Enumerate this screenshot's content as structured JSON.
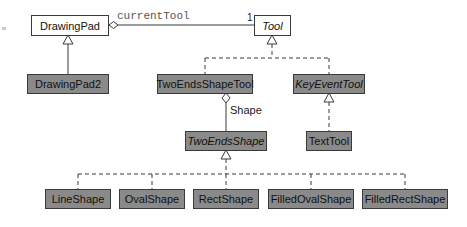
{
  "diagram": {
    "type": "uml-class-diagram",
    "classes": {
      "drawing_pad": "DrawingPad",
      "tool": "Tool",
      "drawing_pad2": "DrawingPad2",
      "two_ends_shape_tool": "TwoEndsShapeTool",
      "key_event_tool": "KeyEventTool",
      "two_ends_shape": "TwoEndsShape",
      "text_tool": "TextTool",
      "line_shape": "LineShape",
      "oval_shape": "OvalShape",
      "rect_shape": "RectShape",
      "filled_oval_shape": "FilledOvalShape",
      "filled_rect_shape": "FilledRectShape"
    },
    "labels": {
      "current_tool": "currentTool",
      "multiplicity": "1",
      "shape": "Shape"
    },
    "relations": [
      {
        "from": "DrawingPad",
        "to": "Tool",
        "type": "aggregation",
        "role": "currentTool",
        "multiplicity": "1"
      },
      {
        "from": "DrawingPad2",
        "to": "DrawingPad",
        "type": "generalization"
      },
      {
        "from": "TwoEndsShapeTool",
        "to": "Tool",
        "type": "realization"
      },
      {
        "from": "KeyEventTool",
        "to": "Tool",
        "type": "realization"
      },
      {
        "from": "TextTool",
        "to": "KeyEventTool",
        "type": "realization"
      },
      {
        "from": "TwoEndsShapeTool",
        "to": "TwoEndsShape",
        "type": "aggregation",
        "role": "Shape"
      },
      {
        "from": "LineShape",
        "to": "TwoEndsShape",
        "type": "realization"
      },
      {
        "from": "OvalShape",
        "to": "TwoEndsShape",
        "type": "realization"
      },
      {
        "from": "RectShape",
        "to": "TwoEndsShape",
        "type": "realization"
      },
      {
        "from": "FilledOvalShape",
        "to": "TwoEndsShape",
        "type": "realization"
      },
      {
        "from": "FilledRectShape",
        "to": "TwoEndsShape",
        "type": "realization"
      }
    ],
    "colors": {
      "line": "#3a3a3a",
      "gray_fill": "#8a8a8a",
      "white_fill": "#ffffff"
    }
  }
}
